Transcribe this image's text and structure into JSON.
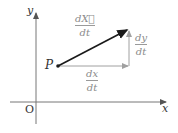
{
  "diagram": {
    "axes": {
      "x_label": "x",
      "y_label": "y",
      "origin_label": "O"
    },
    "point_label": "P",
    "vectors": {
      "velocity": {
        "num": "dX⃗",
        "num_base": "dX",
        "den": "dt",
        "color": "#1a1a1a"
      },
      "dx": {
        "num": "dx",
        "den": "dt",
        "color": "#9a9a9a"
      },
      "dy": {
        "num": "dy",
        "den": "dt",
        "color": "#9a9a9a"
      }
    },
    "colors": {
      "axes": "#555555",
      "main_vector": "#1a1a1a",
      "component_vectors": "#9a9a9a",
      "labels": "#8a8a8a"
    }
  }
}
